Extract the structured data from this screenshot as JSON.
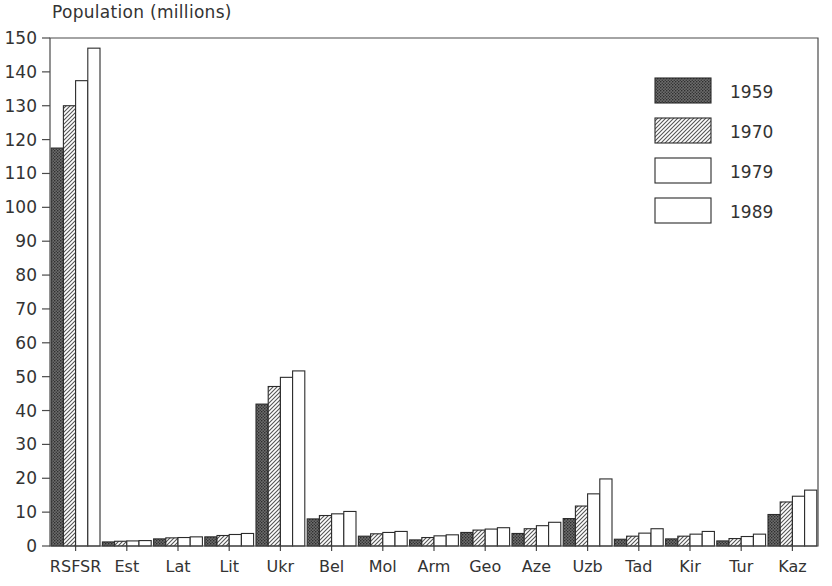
{
  "chart_data": {
    "type": "bar",
    "title": "Population (millions)",
    "xlabel": "",
    "ylabel": "Population (millions)",
    "ylim": [
      0,
      150
    ],
    "yticks": [
      0,
      10,
      20,
      30,
      40,
      50,
      60,
      70,
      80,
      90,
      100,
      110,
      120,
      130,
      140,
      150
    ],
    "grid": false,
    "legend_position": "top-right",
    "categories": [
      "RSFSR",
      "Est",
      "Lat",
      "Lit",
      "Ukr",
      "Bel",
      "Mol",
      "Arm",
      "Geo",
      "Aze",
      "Uzb",
      "Tad",
      "Kir",
      "Tur",
      "Kaz"
    ],
    "series": [
      {
        "name": "1959",
        "fill": "dark-stipple",
        "values": [
          117.5,
          1.2,
          2.1,
          2.7,
          41.9,
          8.0,
          2.9,
          1.8,
          4.0,
          3.7,
          8.1,
          2.0,
          2.1,
          1.5,
          9.3
        ]
      },
      {
        "name": "1970",
        "fill": "diagonal-hatch",
        "values": [
          130.0,
          1.4,
          2.4,
          3.1,
          47.1,
          9.0,
          3.6,
          2.5,
          4.7,
          5.1,
          11.8,
          2.9,
          2.9,
          2.2,
          13.0
        ]
      },
      {
        "name": "1979",
        "fill": "white",
        "values": [
          137.4,
          1.5,
          2.5,
          3.4,
          49.8,
          9.5,
          4.0,
          3.0,
          5.0,
          6.0,
          15.4,
          3.8,
          3.5,
          2.8,
          14.7
        ]
      },
      {
        "name": "1989",
        "fill": "white",
        "values": [
          147.0,
          1.6,
          2.7,
          3.7,
          51.7,
          10.2,
          4.3,
          3.3,
          5.4,
          7.0,
          19.8,
          5.1,
          4.3,
          3.5,
          16.5
        ]
      }
    ]
  },
  "colors": {
    "axis": "#4a4a4a",
    "text": "#333333",
    "bar_outline": "#2b2b2b",
    "series_1959": "#555555",
    "series_1970": "#8a8a8a",
    "series_1979": "#ffffff",
    "series_1989": "#ffffff",
    "background": "#ffffff"
  }
}
